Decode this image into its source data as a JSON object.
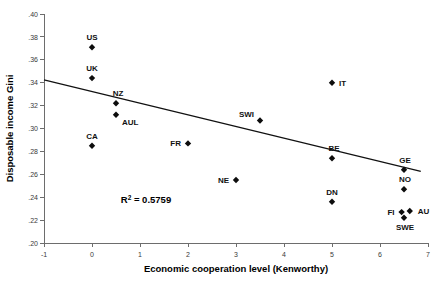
{
  "chart_data": {
    "type": "scatter",
    "title": "",
    "xlabel": "Economic cooperation level (Kenworthy)",
    "ylabel": "Disposable income Gini",
    "xlim": [
      -1,
      7
    ],
    "ylim": [
      0.2,
      0.4
    ],
    "xticks": [
      "-1",
      "0",
      "1",
      "2",
      "3",
      "4",
      "5",
      "6",
      "7"
    ],
    "xtick_values": [
      -1,
      0,
      1,
      2,
      3,
      4,
      5,
      6,
      7
    ],
    "yticks": [
      ".20",
      ".22",
      ".24",
      ".26",
      ".28",
      ".30",
      ".32",
      ".34",
      ".36",
      ".38",
      ".40"
    ],
    "ytick_values": [
      0.2,
      0.22,
      0.24,
      0.26,
      0.28,
      0.3,
      0.32,
      0.34,
      0.36,
      0.38,
      0.4
    ],
    "grid": false,
    "legend": "none",
    "annotations": [
      {
        "name": "r-squared",
        "text": "R2 = 0.5759",
        "text_prefix": "R",
        "text_sup": "2",
        "text_suffix": " = 0.5759",
        "x": 0.6,
        "y": 0.235
      }
    ],
    "trendline": {
      "name": "linear-fit",
      "x_start": -1.0,
      "y_start": 0.3425,
      "x_end": 6.85,
      "y_end": 0.2625,
      "r_squared": 0.5759
    },
    "points": [
      {
        "label": "US",
        "x": 0.0,
        "y": 0.371,
        "label_dx": 0,
        "label_dy": -7,
        "label_anchor": "middle"
      },
      {
        "label": "UK",
        "x": 0.0,
        "y": 0.344,
        "label_dx": 0,
        "label_dy": -7,
        "label_anchor": "middle"
      },
      {
        "label": "NZ",
        "x": 0.5,
        "y": 0.322,
        "label_dx": 2,
        "label_dy": -7,
        "label_anchor": "middle"
      },
      {
        "label": "AUL",
        "x": 0.5,
        "y": 0.312,
        "label_dx": 6,
        "label_dy": 10,
        "label_anchor": "start"
      },
      {
        "label": "CA",
        "x": 0.0,
        "y": 0.285,
        "label_dx": 0,
        "label_dy": -7,
        "label_anchor": "middle"
      },
      {
        "label": "FR",
        "x": 2.0,
        "y": 0.287,
        "label_dx": -7,
        "label_dy": 3,
        "label_anchor": "end"
      },
      {
        "label": "NE",
        "x": 3.0,
        "y": 0.255,
        "label_dx": -7,
        "label_dy": 3,
        "label_anchor": "end"
      },
      {
        "label": "SWI",
        "x": 3.5,
        "y": 0.307,
        "label_dx": -6,
        "label_dy": -3,
        "label_anchor": "end"
      },
      {
        "label": "IT",
        "x": 5.0,
        "y": 0.34,
        "label_dx": 7,
        "label_dy": 3,
        "label_anchor": "start"
      },
      {
        "label": "BE",
        "x": 5.0,
        "y": 0.274,
        "label_dx": 2,
        "label_dy": -7,
        "label_anchor": "middle"
      },
      {
        "label": "DN",
        "x": 5.0,
        "y": 0.236,
        "label_dx": 0,
        "label_dy": -7,
        "label_anchor": "middle"
      },
      {
        "label": "GE",
        "x": 6.5,
        "y": 0.264,
        "label_dx": 1,
        "label_dy": -7,
        "label_anchor": "middle"
      },
      {
        "label": "NO",
        "x": 6.5,
        "y": 0.247,
        "label_dx": 1,
        "label_dy": -7,
        "label_anchor": "middle"
      },
      {
        "label": "FI",
        "x": 6.45,
        "y": 0.227,
        "label_dx": -7,
        "label_dy": 3,
        "label_anchor": "end"
      },
      {
        "label": "AU",
        "x": 6.62,
        "y": 0.228,
        "label_dx": 8,
        "label_dy": 3,
        "label_anchor": "start"
      },
      {
        "label": "SWE",
        "x": 6.5,
        "y": 0.222,
        "label_dx": 1,
        "label_dy": 12,
        "label_anchor": "middle"
      }
    ]
  }
}
